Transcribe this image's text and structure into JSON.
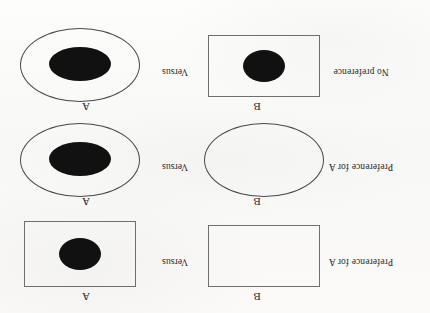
{
  "figure": {
    "orientation": "rotated-180",
    "background_color": "#fbfbfa",
    "stroke_color": "#4a4a4c",
    "fill_color": "#111111",
    "option_label_left": "B",
    "option_label_right": "A",
    "versus_label": "Versus",
    "rows": [
      {
        "id": "row-1",
        "outcome": "Preference for A",
        "versus": "Versus",
        "left": {
          "label": "B",
          "outer_shape": "rectangle",
          "has_inner_blob": false
        },
        "right": {
          "label": "A",
          "outer_shape": "rectangle",
          "has_inner_blob": true
        }
      },
      {
        "id": "row-2",
        "outcome": "Preference for A",
        "versus": "Versus",
        "left": {
          "label": "B",
          "outer_shape": "ellipse",
          "has_inner_blob": false
        },
        "right": {
          "label": "A",
          "outer_shape": "ellipse",
          "has_inner_blob": true
        }
      },
      {
        "id": "row-3",
        "outcome": "No preference",
        "versus": "Versus",
        "left": {
          "label": "B",
          "outer_shape": "rectangle",
          "has_inner_blob": true
        },
        "right": {
          "label": "A",
          "outer_shape": "ellipse",
          "has_inner_blob": true
        }
      }
    ]
  }
}
